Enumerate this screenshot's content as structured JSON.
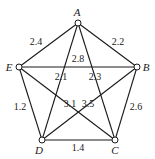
{
  "diagram": {
    "type": "weighted-graph",
    "nodes": [
      {
        "id": "A",
        "label": "A",
        "x": 78,
        "y": 23,
        "lx": 77,
        "ly": 16
      },
      {
        "id": "B",
        "label": "B",
        "x": 137,
        "y": 67,
        "lx": 146,
        "ly": 71
      },
      {
        "id": "C",
        "label": "C",
        "x": 115,
        "y": 140,
        "lx": 115,
        "ly": 154
      },
      {
        "id": "D",
        "label": "D",
        "x": 42,
        "y": 140,
        "lx": 39,
        "ly": 154
      },
      {
        "id": "E",
        "label": "E",
        "x": 19,
        "y": 67,
        "lx": 9,
        "ly": 71
      }
    ],
    "edges": [
      {
        "from": "A",
        "to": "E",
        "weight": "2.4",
        "wx": 36,
        "wy": 45
      },
      {
        "from": "A",
        "to": "B",
        "weight": "2.2",
        "wx": 118,
        "wy": 45
      },
      {
        "from": "E",
        "to": "B",
        "weight": "2.8",
        "wx": 78,
        "wy": 62
      },
      {
        "from": "A",
        "to": "D",
        "weight": "2.1",
        "wx": 61,
        "wy": 80
      },
      {
        "from": "A",
        "to": "C",
        "weight": "2.3",
        "wx": 95,
        "wy": 80
      },
      {
        "from": "E",
        "to": "D",
        "weight": "1.2",
        "wx": 20,
        "wy": 110
      },
      {
        "from": "E",
        "to": "C",
        "weight": "3.1",
        "wx": 70,
        "wy": 107
      },
      {
        "from": "B",
        "to": "D",
        "weight": "3.5",
        "wx": 88,
        "wy": 107
      },
      {
        "from": "B",
        "to": "C",
        "weight": "2.6",
        "wx": 136,
        "wy": 110
      },
      {
        "from": "D",
        "to": "C",
        "weight": "1.4",
        "wx": 78,
        "wy": 151
      }
    ]
  }
}
